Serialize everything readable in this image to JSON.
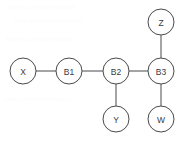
{
  "figure": {
    "type": "node-link-graph",
    "width": 187,
    "height": 142,
    "background_color": "#ffffff",
    "stroke_color": "#4a4a4a",
    "label_color": "#3a3a3a",
    "node_radius": 13
  },
  "nodes": [
    {
      "id": "X",
      "label": "X",
      "cx": 23,
      "cy": 71,
      "r": 13
    },
    {
      "id": "B1",
      "label": "B1",
      "cx": 69,
      "cy": 71,
      "r": 13
    },
    {
      "id": "B2",
      "label": "B2",
      "cx": 116,
      "cy": 71,
      "r": 13
    },
    {
      "id": "B3",
      "label": "B3",
      "cx": 161,
      "cy": 71,
      "r": 13
    },
    {
      "id": "Z",
      "label": "Z",
      "cx": 161,
      "cy": 22,
      "r": 13
    },
    {
      "id": "Y",
      "label": "Y",
      "cx": 116,
      "cy": 119,
      "r": 13
    },
    {
      "id": "W",
      "label": "W",
      "cx": 161,
      "cy": 119,
      "r": 13
    }
  ],
  "edges": [
    {
      "id": "X-B1",
      "source": "X",
      "target": "B1",
      "x1": 36,
      "y1": 71,
      "x2": 56,
      "y2": 71
    },
    {
      "id": "B1-B2",
      "source": "B1",
      "target": "B2",
      "x1": 82,
      "y1": 71,
      "x2": 103,
      "y2": 71
    },
    {
      "id": "B2-B3",
      "source": "B2",
      "target": "B3",
      "x1": 129,
      "y1": 71,
      "x2": 148,
      "y2": 71
    },
    {
      "id": "B2-Y",
      "source": "B2",
      "target": "Y",
      "x1": 116,
      "y1": 84,
      "x2": 116,
      "y2": 106
    },
    {
      "id": "B3-Z",
      "source": "B3",
      "target": "Z",
      "x1": 161,
      "y1": 58,
      "x2": 161,
      "y2": 35
    },
    {
      "id": "B3-W",
      "source": "B3",
      "target": "W",
      "x1": 161,
      "y1": 84,
      "x2": 161,
      "y2": 106
    }
  ],
  "background_artifacts": [
    {
      "text": "faint scan bleed-through",
      "x": 8,
      "y": 6
    },
    {
      "text": "faint scan bleed-through",
      "x": 14,
      "y": 20
    },
    {
      "text": "faint scan bleed-through",
      "x": 6,
      "y": 38
    },
    {
      "text": "faint scan bleed-through",
      "x": 4,
      "y": 98
    }
  ]
}
